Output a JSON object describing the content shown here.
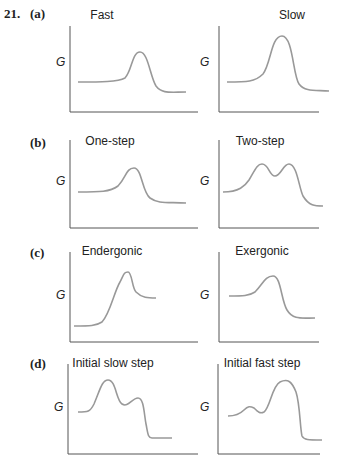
{
  "question_number": "21.",
  "rows": [
    {
      "label": "(a)",
      "panels": [
        {
          "title": "Fast",
          "y_label": "G",
          "path": "M8 56 C 30 56, 48 56, 55 52 C 62 45, 62 26, 70 26 C 78 26, 80 50, 86 60 C 92 68, 100 66, 116 66"
        },
        {
          "title": "Slow",
          "y_label": "G",
          "path": "M8 56 C 28 56, 36 56, 44 48 C 52 38, 52 10, 63 10 C 74 10, 74 50, 80 58 C 86 66, 96 64, 110 65"
        }
      ]
    },
    {
      "label": "(b)",
      "panels": [
        {
          "title": "One-step",
          "y_label": "G",
          "path": "M8 52 C 30 52, 40 52, 48 46 C 56 38, 56 28, 64 28 C 72 28, 72 52, 80 58 C 88 64, 98 62, 116 63"
        },
        {
          "title": "Two-step",
          "y_label": "G",
          "path": "M4 52 C 20 52, 26 46, 30 40 C 36 30, 38 24, 43 24 C 50 24, 50 36, 56 36 C 62 36, 64 24, 70 24 C 78 24, 80 48, 84 56 C 90 66, 96 66, 104 66"
        }
      ]
    },
    {
      "label": "(c)",
      "panels": [
        {
          "title": "Endergonic",
          "y_label": "G",
          "path": "M4 74 C 20 74, 26 74, 32 70 C 40 62, 44 40, 50 30 C 54 22, 54 20, 58 20 C 62 20, 62 36, 66 40 C 72 46, 78 46, 86 46"
        },
        {
          "title": "Exergonic",
          "y_label": "G",
          "path": "M10 44 C 24 44, 30 44, 36 40 C 44 32, 46 24, 54 24 C 62 24, 62 48, 68 58 C 74 68, 82 66, 96 66"
        }
      ]
    },
    {
      "label": "(d)",
      "panels": [
        {
          "title": "Initial slow step",
          "y_label": "G",
          "path": "M10 48 C 20 48, 22 48, 26 40 C 32 26, 34 16, 40 16 C 48 16, 48 36, 54 40 C 60 44, 64 34, 70 34 C 76 34, 76 50, 78 60 C 80 70, 80 74, 84 74 C 90 74, 96 74, 104 74"
        },
        {
          "title": "Initial fast step",
          "y_label": "G",
          "path": "M10 52 C 18 52, 22 50, 26 46 C 30 42, 32 42, 36 44 C 40 48, 42 50, 46 48 C 52 44, 54 22, 62 18 C 70 14, 74 18, 78 28 C 82 40, 82 64, 84 72 C 86 76, 90 76, 104 76"
        }
      ]
    }
  ]
}
